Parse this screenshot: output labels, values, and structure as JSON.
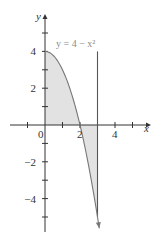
{
  "chart_data": {
    "type": "area",
    "title": "",
    "equation_label": "y = 4 − x²",
    "xlabel": "x",
    "ylabel": "y",
    "xlim": [
      -1.6,
      5.9
    ],
    "ylim": [
      -5.7,
      6.0
    ],
    "x_ticks": [
      -1,
      1,
      2,
      3,
      4,
      5
    ],
    "x_tick_labels": [
      {
        "value": 0,
        "text": "0"
      },
      {
        "value": 2,
        "text": "2"
      },
      {
        "value": 4,
        "text": "4"
      }
    ],
    "y_ticks": [
      -5,
      -4,
      -3,
      -2,
      -1,
      1,
      2,
      3,
      4,
      5
    ],
    "y_tick_labels": [
      {
        "value": 4,
        "text": "4"
      },
      {
        "value": 2,
        "text": "2"
      },
      {
        "value": -2,
        "text": "−2"
      },
      {
        "value": -4,
        "text": "−4"
      }
    ],
    "series": [
      {
        "name": "y = 4 − x²",
        "function": "4 - x^2",
        "x_range": [
          0,
          3.1
        ],
        "points": [
          [
            0,
            4
          ],
          [
            0.5,
            3.75
          ],
          [
            1,
            3
          ],
          [
            1.5,
            1.75
          ],
          [
            2,
            0
          ],
          [
            2.5,
            -2.25
          ],
          [
            3,
            -5
          ],
          [
            3.1,
            -5.61
          ]
        ],
        "end_arrow": true
      }
    ],
    "vertical_line": {
      "x": 3,
      "y_range": [
        -5,
        4
      ]
    },
    "shaded_regions": [
      {
        "description": "between curve and x-axis from x=0 to x=2",
        "x_range": [
          0,
          2
        ]
      },
      {
        "description": "between x-axis and curve from x=2 to x=3",
        "x_range": [
          2,
          3
        ]
      }
    ],
    "grid": false,
    "legend": null,
    "colors": {
      "curve": "#777777",
      "fill": "#e2e2e2",
      "axis": "#333333",
      "label": "#8a8a8a"
    }
  }
}
